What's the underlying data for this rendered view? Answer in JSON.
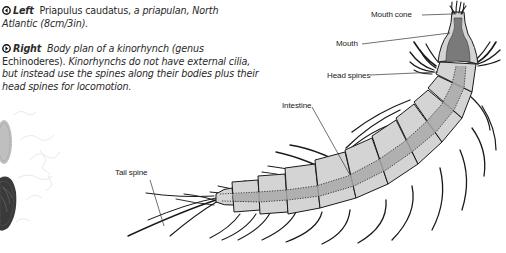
{
  "captions": {
    "left": {
      "direction": "Left",
      "icon": "arrow-left-circle-icon",
      "text_roman": "Priapulus caudatus,",
      "text_italic": " a priapulan, North Atlantic (8cm/3in)."
    },
    "right": {
      "direction": "Right",
      "icon": "arrow-right-circle-icon",
      "text_italic_1": "Body plan of a kinorhynch (genus",
      "text_roman": " Echinoderes).",
      "text_italic_2": " Kinorhynchs do not have external cilia, but instead use the spines along their bodies plus their head spines for locomotion."
    }
  },
  "diagram": {
    "labels": {
      "mouth_cone": "Mouth cone",
      "mouth": "Mouth",
      "head_spines": "Head spines",
      "intestine": "Intestine",
      "tail_spine": "Tail spine"
    },
    "colors": {
      "segment_fill": "#d4d4d4",
      "intestine_fill": "#a9a9a9",
      "mouth_fill": "#7a7a7a",
      "outline": "#1a1a1a"
    }
  },
  "left_photo": {
    "subject": "Priapulus caudatus specimen (partially cropped)"
  }
}
